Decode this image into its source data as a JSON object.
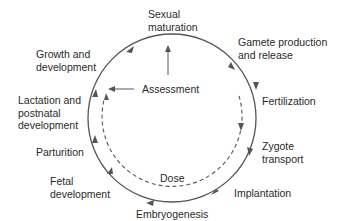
{
  "stages": {
    "sexual_maturation": "Sexual\nmaturation",
    "gamete": "Gamete production\nand release",
    "fertilization": "Fertilization",
    "zygote": "Zygote\ntransport",
    "implantation": "Implantation",
    "embryogenesis": "Embryogenesis",
    "fetal": "Fetal\ndevelopment",
    "parturition": "Parturition",
    "lactation": "Lactation and\npostnatal\ndevelopment",
    "growth": "Growth and\ndevelopment"
  },
  "center": {
    "assessment": "Assessment",
    "dose": "Dose"
  },
  "colors": {
    "line": "#555555",
    "text": "#2a2a2a"
  }
}
